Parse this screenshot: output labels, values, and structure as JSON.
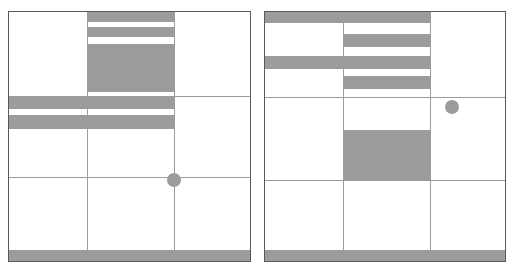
{
  "figure": {
    "title": "",
    "background_color": "#ffffff",
    "fill_color": "#9c9c9c",
    "grid_line_color": "#9c9c9c",
    "frame_color": "#5a5a5a",
    "panel_count": 2
  },
  "chart_data": {
    "type": "heatmap",
    "title": "",
    "subtitle": "",
    "xlabel": "",
    "ylabel": "",
    "grid": true,
    "legend": "none",
    "panels": [
      {
        "name": "left-panel",
        "bounds_px": {
          "x": 8,
          "y": 11,
          "width": 243,
          "height": 251
        },
        "grid": {
          "columns": 3,
          "rows": 3,
          "vertical_lines_px": [
            87,
            174
          ],
          "horizontal_lines_px": [
            96,
            177
          ]
        },
        "bands": [
          {
            "name": "band-1",
            "x": 87,
            "y": 11,
            "width": 88,
            "height": 11
          },
          {
            "name": "band-2",
            "x": 87,
            "y": 27,
            "width": 88,
            "height": 10
          },
          {
            "name": "band-3",
            "x": 87,
            "y": 44,
            "width": 88,
            "height": 48
          },
          {
            "name": "band-4",
            "x": 8,
            "y": 96,
            "width": 167,
            "height": 13
          },
          {
            "name": "band-5",
            "x": 8,
            "y": 115,
            "width": 167,
            "height": 14
          },
          {
            "name": "band-bottom",
            "x": 8,
            "y": 250,
            "width": 243,
            "height": 12
          }
        ],
        "marker": {
          "name": "circle-marker",
          "cx": 174,
          "cy": 180,
          "r": 7
        }
      },
      {
        "name": "right-panel",
        "bounds_px": {
          "x": 264,
          "y": 11,
          "width": 242,
          "height": 251
        },
        "grid": {
          "columns": 3,
          "rows": 3,
          "vertical_lines_px": [
            343,
            430
          ],
          "horizontal_lines_px": [
            97,
            180
          ]
        },
        "bands": [
          {
            "name": "band-1",
            "x": 264,
            "y": 11,
            "width": 166,
            "height": 12
          },
          {
            "name": "band-2",
            "x": 343,
            "y": 34,
            "width": 87,
            "height": 13
          },
          {
            "name": "band-3",
            "x": 264,
            "y": 56,
            "width": 166,
            "height": 13
          },
          {
            "name": "band-4",
            "x": 343,
            "y": 76,
            "width": 87,
            "height": 13
          },
          {
            "name": "band-5",
            "x": 343,
            "y": 130,
            "width": 87,
            "height": 50
          },
          {
            "name": "band-bottom",
            "x": 264,
            "y": 250,
            "width": 242,
            "height": 12
          }
        ],
        "marker": {
          "name": "circle-marker",
          "cx": 452,
          "cy": 107,
          "r": 7
        }
      }
    ]
  }
}
